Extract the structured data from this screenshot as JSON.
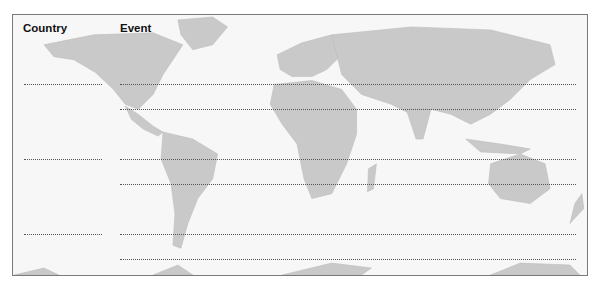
{
  "worksheet": {
    "headers": {
      "country": "Country",
      "event": "Event"
    },
    "rows": [
      {
        "country": "",
        "events": [
          "",
          ""
        ]
      },
      {
        "country": "",
        "events": [
          "",
          ""
        ]
      },
      {
        "country": "",
        "events": [
          "",
          ""
        ]
      }
    ],
    "background": "world-map",
    "colors": {
      "land": "#c9c9c9",
      "paper": "#f7f7f7",
      "border": "#7a7a7a",
      "dots": "#555555"
    }
  }
}
